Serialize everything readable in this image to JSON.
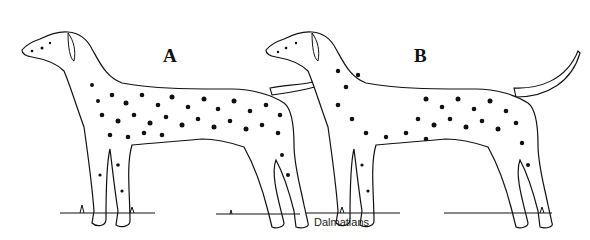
{
  "figure": {
    "caption": "Dalmatians",
    "labels": [
      "A",
      "B"
    ],
    "line_color": "#111111",
    "background": "#ffffff"
  }
}
